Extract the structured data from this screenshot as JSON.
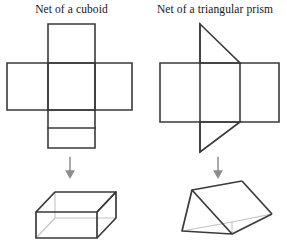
{
  "page": {
    "background_color": "#ffffff",
    "stroke_color": "#3a3a3a",
    "faint_stroke_color": "#b9b9b9",
    "text_color": "#16161a"
  },
  "figures": [
    {
      "id": "cuboid",
      "title": "Net of a cuboid",
      "net": {
        "description": "cross-shaped net of six rectangles",
        "faces": 6,
        "shape_type": "net",
        "vertical_strip": {
          "x1": 48,
          "y1": 24,
          "x2": 95,
          "y2": 148
        },
        "horizontal_strip": {
          "x1": 7,
          "y1": 63,
          "x2": 132,
          "y2": 110
        },
        "internal_lines": [
          {
            "x1": 48,
            "y1": 63,
            "x2": 95,
            "y2": 63
          },
          {
            "x1": 48,
            "y1": 110,
            "x2": 95,
            "y2": 110
          },
          {
            "x1": 48,
            "y1": 128,
            "x2": 95,
            "y2": 128
          },
          {
            "x1": 48,
            "y1": 63,
            "x2": 48,
            "y2": 110
          },
          {
            "x1": 95,
            "y1": 63,
            "x2": 95,
            "y2": 110
          }
        ]
      },
      "arrow": {
        "x": 70,
        "y_start": 157,
        "y_end": 177,
        "direction": "down"
      },
      "solid": {
        "name": "cuboid",
        "shape_type": "3d-solid",
        "front_face": {
          "x1": 36,
          "y1": 212,
          "x2": 97,
          "y2": 238
        },
        "back_face": {
          "x1": 55,
          "y1": 192,
          "x2": 116,
          "y2": 218
        }
      }
    },
    {
      "id": "prism",
      "title": "Net of a triangular prism",
      "net": {
        "description": "rectangle with two triangular flaps",
        "faces": 5,
        "shape_type": "net",
        "rectangle": {
          "x1": 160,
          "y1": 63,
          "x2": 279,
          "y2": 122
        },
        "internal_lines": [
          {
            "x1": 200,
            "y1": 63,
            "x2": 200,
            "y2": 122
          },
          {
            "x1": 240,
            "y1": 63,
            "x2": 240,
            "y2": 122
          }
        ],
        "top_triangle": [
          {
            "x": 200,
            "y": 24
          },
          {
            "x": 240,
            "y": 63
          },
          {
            "x": 200,
            "y": 63
          }
        ],
        "bottom_triangle": [
          {
            "x": 200,
            "y": 152
          },
          {
            "x": 240,
            "y": 122
          },
          {
            "x": 200,
            "y": 122
          }
        ]
      },
      "arrow": {
        "x": 218,
        "y_start": 157,
        "y_end": 177,
        "direction": "down"
      },
      "solid": {
        "name": "triangular prism",
        "shape_type": "3d-solid",
        "front_triangle": [
          {
            "x": 192,
            "y": 190
          },
          {
            "x": 182,
            "y": 231
          },
          {
            "x": 232,
            "y": 234
          }
        ],
        "back_triangle": [
          {
            "x": 242,
            "y": 181
          },
          {
            "x": 232,
            "y": 222
          },
          {
            "x": 272,
            "y": 214
          }
        ]
      }
    }
  ]
}
